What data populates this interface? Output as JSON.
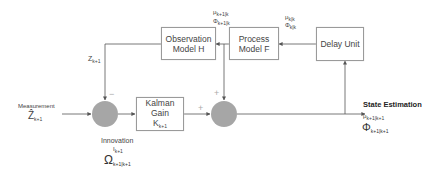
{
  "diagram": {
    "title": "",
    "blocks": {
      "observation_model": {
        "line1": "Observation",
        "line2": "Model H"
      },
      "process_model": {
        "line1": "Process",
        "line2": "Model F"
      },
      "delay_unit": {
        "label": "Delay Unit"
      },
      "kalman_gain": {
        "line1": "Kalman",
        "line2": "Gain",
        "symbol": "K",
        "symbol_sub": "k+1"
      }
    },
    "labels": {
      "measurement": "Measurement",
      "measurement_symbol": "Ẑ",
      "measurement_sub": "k+1",
      "predicted_obs_symbol": "Z",
      "predicted_obs_sub": "k+1",
      "innovation": "Innovation",
      "innovation_symbol": "I",
      "innovation_sub": "k+1",
      "innovation_cov_symbol": "Ω",
      "innovation_cov_sub": "k+1|k+1",
      "process_in_mu": "μ",
      "process_in_mu_sub": "k|k",
      "process_in_phi": "Φ",
      "process_in_phi_sub": "k|k",
      "process_out_mu": "μ",
      "process_out_mu_sub": "k+1|k",
      "process_out_phi": "Φ",
      "process_out_phi_sub": "k+1|k",
      "state_estimation": "State Estimation",
      "state_mu": "μ",
      "state_mu_sub": "k+1|k+1",
      "state_phi": "Φ",
      "state_phi_sub": "k+1|k+1"
    },
    "signs": {
      "minus": "−",
      "plus_left": "+",
      "plus_top": "+"
    },
    "colors": {
      "junction": "#a6a6a6",
      "line": "#555555",
      "box_border": "#9a9a9a"
    }
  }
}
